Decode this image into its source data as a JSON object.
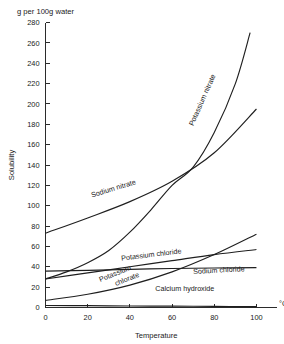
{
  "figure": {
    "header_note": "g per 100g water",
    "unit_label": "°C"
  },
  "chart_data": {
    "type": "line",
    "title": "",
    "subtitle": "",
    "header_note": "g per 100g water",
    "xlabel": "Temperature",
    "ylabel": "Solubility",
    "x_unit": "°C",
    "y_unit": "g per 100g water",
    "xlim": [
      0,
      105
    ],
    "ylim": [
      0,
      280
    ],
    "xticks": [
      0,
      20,
      40,
      60,
      80,
      100
    ],
    "yticks": [
      0,
      20,
      40,
      60,
      80,
      100,
      120,
      140,
      160,
      180,
      200,
      220,
      240,
      260,
      280
    ],
    "grid": false,
    "legend": "inline-curve-labels",
    "line_color": "#1f1f1f",
    "series": [
      {
        "name": "Potassium nitrate",
        "label": "Potassium nitrate",
        "label_rotation": -66,
        "label_x": 70,
        "label_y": 178,
        "x": [
          0,
          10,
          20,
          30,
          40,
          50,
          60,
          70,
          80,
          90,
          97
        ],
        "values": [
          28,
          35,
          44,
          56,
          74,
          96,
          120,
          138,
          172,
          220,
          270
        ]
      },
      {
        "name": "Sodium nitrate",
        "label": "Sodium nitrate",
        "label_rotation": -17,
        "label_x": 22,
        "label_y": 108,
        "x": [
          0,
          20,
          40,
          60,
          80,
          100
        ],
        "values": [
          73,
          88,
          104,
          124,
          152,
          195
        ]
      },
      {
        "name": "Potassium chloride",
        "label": "Potassium chloride",
        "label_rotation": -7,
        "label_x": 36,
        "label_y": 46,
        "x": [
          0,
          20,
          40,
          60,
          80,
          100
        ],
        "values": [
          28,
          34,
          40,
          46,
          52,
          57
        ]
      },
      {
        "name": "Sodium chloride",
        "label": "Sodium chloride",
        "label_rotation": -3,
        "label_x": 70,
        "label_y": 33,
        "x": [
          0,
          20,
          40,
          60,
          80,
          100
        ],
        "values": [
          35.7,
          36.5,
          37.5,
          38.3,
          38.8,
          39.2
        ]
      },
      {
        "name": "Potassium chlorate",
        "label_line_1": "Potassium",
        "label_line_2": "chlorate",
        "label_rotation": -22,
        "label_x": 26,
        "label_y": 25,
        "x": [
          0,
          20,
          40,
          60,
          80,
          100
        ],
        "values": [
          7,
          13,
          22,
          35,
          52,
          72
        ]
      },
      {
        "name": "Calcium hydroxide",
        "label": "Calcium hydroxide",
        "label_rotation": 0,
        "label_x": 52,
        "label_y": 16,
        "x": [
          0,
          20,
          40,
          60,
          80,
          100
        ],
        "values": [
          2.0,
          1.8,
          1.5,
          1.3,
          1.1,
          0.9
        ]
      }
    ]
  }
}
